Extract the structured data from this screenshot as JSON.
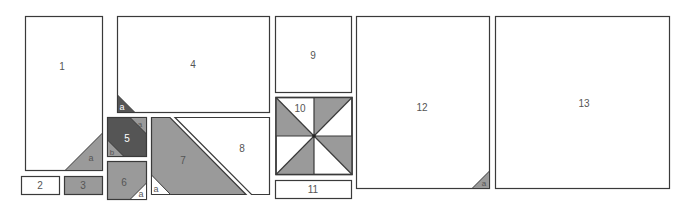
{
  "diagram": {
    "colors": {
      "outline": "#3a3a3a",
      "light": "#ffffff",
      "medium": "#9a9a9a",
      "dark": "#555555",
      "label": "#555555",
      "label_on_dark": "#ffffff"
    },
    "pieces": [
      {
        "id": "1",
        "label": "1",
        "sub": [
          {
            "label": "a",
            "fill": "medium"
          }
        ]
      },
      {
        "id": "2",
        "label": "2"
      },
      {
        "id": "3",
        "label": "3",
        "fill": "medium"
      },
      {
        "id": "4",
        "label": "4",
        "sub": [
          {
            "label": "a",
            "fill": "dark"
          }
        ]
      },
      {
        "id": "5",
        "label": "5",
        "fill": "dark",
        "sub": [
          {
            "label": "a",
            "fill": "medium"
          },
          {
            "label": "b",
            "fill": "medium"
          }
        ]
      },
      {
        "id": "6",
        "label": "6",
        "fill": "medium",
        "sub": [
          {
            "label": "a",
            "fill": "light"
          }
        ]
      },
      {
        "id": "7",
        "label": "7",
        "fill": "medium",
        "sub": [
          {
            "label": "a",
            "fill": "light"
          }
        ]
      },
      {
        "id": "8",
        "label": "8"
      },
      {
        "id": "9",
        "label": "9"
      },
      {
        "id": "10",
        "label": "10",
        "pattern": "pinwheel"
      },
      {
        "id": "11",
        "label": "11"
      },
      {
        "id": "12",
        "label": "12",
        "sub": [
          {
            "label": "a",
            "fill": "medium"
          }
        ]
      },
      {
        "id": "13",
        "label": "13"
      }
    ]
  }
}
